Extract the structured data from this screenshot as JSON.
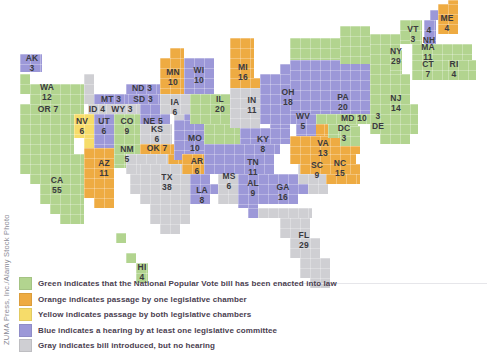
{
  "colors": {
    "green": "#b2d48f",
    "orange": "#eeab42",
    "yellow": "#f6dc6a",
    "blue": "#9c98d8",
    "gray": "#cfcfd3"
  },
  "legend": [
    {
      "color": "green",
      "text": "Green indicates that the National Popular Vote bill has been enacted into law"
    },
    {
      "color": "orange",
      "text": "Orange indicates passage by one legislative chamber"
    },
    {
      "color": "yellow",
      "text": "Yellow indicates passage by both legislative chambers"
    },
    {
      "color": "blue",
      "text": "Blue indicates a hearing by at least one legislative committee"
    },
    {
      "color": "gray",
      "text": "Gray indicates bill introduced, but no hearing"
    }
  ],
  "credit": "ZUMA Press, Inc./Alamy Stock Photo",
  "states": [
    {
      "abbr": "AK",
      "votes": "3",
      "status": "blue"
    },
    {
      "abbr": "WA",
      "votes": "12",
      "status": "green"
    },
    {
      "abbr": "OR",
      "votes": "7",
      "status": "green"
    },
    {
      "abbr": "CA",
      "votes": "55",
      "status": "green"
    },
    {
      "abbr": "NV",
      "votes": "6",
      "status": "yellow"
    },
    {
      "abbr": "ID",
      "votes": "4",
      "status": "gray"
    },
    {
      "abbr": "MT",
      "votes": "3",
      "status": "blue"
    },
    {
      "abbr": "WY",
      "votes": "3",
      "status": "gray"
    },
    {
      "abbr": "UT",
      "votes": "6",
      "status": "blue"
    },
    {
      "abbr": "CO",
      "votes": "9",
      "status": "green"
    },
    {
      "abbr": "AZ",
      "votes": "11",
      "status": "orange"
    },
    {
      "abbr": "NM",
      "votes": "5",
      "status": "green"
    },
    {
      "abbr": "ND",
      "votes": "3",
      "status": "blue"
    },
    {
      "abbr": "SD",
      "votes": "3",
      "status": "blue"
    },
    {
      "abbr": "NE",
      "votes": "5",
      "status": "blue"
    },
    {
      "abbr": "KS",
      "votes": "6",
      "status": "gray"
    },
    {
      "abbr": "OK",
      "votes": "7",
      "status": "orange"
    },
    {
      "abbr": "TX",
      "votes": "38",
      "status": "gray"
    },
    {
      "abbr": "MN",
      "votes": "10",
      "status": "orange"
    },
    {
      "abbr": "IA",
      "votes": "6",
      "status": "gray"
    },
    {
      "abbr": "MO",
      "votes": "10",
      "status": "blue"
    },
    {
      "abbr": "AR",
      "votes": "6",
      "status": "orange"
    },
    {
      "abbr": "LA",
      "votes": "8",
      "status": "blue"
    },
    {
      "abbr": "WI",
      "votes": "10",
      "status": "blue"
    },
    {
      "abbr": "IL",
      "votes": "20",
      "status": "green"
    },
    {
      "abbr": "MI",
      "votes": "16",
      "status": "orange"
    },
    {
      "abbr": "IN",
      "votes": "11",
      "status": "gray"
    },
    {
      "abbr": "OH",
      "votes": "18",
      "status": "blue"
    },
    {
      "abbr": "KY",
      "votes": "8",
      "status": "blue"
    },
    {
      "abbr": "TN",
      "votes": "11",
      "status": "blue"
    },
    {
      "abbr": "MS",
      "votes": "6",
      "status": "gray"
    },
    {
      "abbr": "AL",
      "votes": "9",
      "status": "blue"
    },
    {
      "abbr": "GA",
      "votes": "16",
      "status": "blue"
    },
    {
      "abbr": "FL",
      "votes": "29",
      "status": "gray"
    },
    {
      "abbr": "SC",
      "votes": "9",
      "status": "gray"
    },
    {
      "abbr": "NC",
      "votes": "15",
      "status": "orange"
    },
    {
      "abbr": "VA",
      "votes": "13",
      "status": "orange"
    },
    {
      "abbr": "WV",
      "votes": "5",
      "status": "blue"
    },
    {
      "abbr": "PA",
      "votes": "20",
      "status": "blue"
    },
    {
      "abbr": "MD",
      "votes": "10",
      "status": "green"
    },
    {
      "abbr": "DC",
      "votes": "3",
      "status": "green"
    },
    {
      "abbr": "DE",
      "votes": "3",
      "status": "green"
    },
    {
      "abbr": "NJ",
      "votes": "14",
      "status": "green"
    },
    {
      "abbr": "NY",
      "votes": "29",
      "status": "green"
    },
    {
      "abbr": "VT",
      "votes": "3",
      "status": "green"
    },
    {
      "abbr": "NH",
      "votes": "4",
      "status": "blue"
    },
    {
      "abbr": "ME",
      "votes": "4",
      "status": "orange"
    },
    {
      "abbr": "MA",
      "votes": "11",
      "status": "green"
    },
    {
      "abbr": "CT",
      "votes": "7",
      "status": "green"
    },
    {
      "abbr": "RI",
      "votes": "4",
      "status": "green"
    },
    {
      "abbr": "HI",
      "votes": "4",
      "status": "green"
    }
  ],
  "labels": {
    "AK": "AK\n3",
    "WA": "WA\n12",
    "OR": "OR 7",
    "CA": "CA\n55",
    "NV": "NV\n6",
    "ID": "ID 4",
    "MT": "MT 3",
    "WY": "WY 3",
    "UT": "UT\n6",
    "CO": "CO\n9",
    "AZ": "AZ\n11",
    "NM": "NM\n5",
    "ND": "ND 3",
    "SD": "SD 3",
    "NE": "NE 5",
    "KS": "KS\n6",
    "OK": "OK 7",
    "TX": "TX\n38",
    "MN": "MN\n10",
    "IA": "IA\n6",
    "MO": "MO\n10",
    "AR": "AR\n6",
    "LA": "LA\n8",
    "WI": "WI\n10",
    "IL": "IL\n20",
    "MI": "MI\n16",
    "IN": "IN\n11",
    "OH": "OH\n18",
    "KY": "KY\n8",
    "TN": "TN\n11",
    "MS": "MS\n6",
    "AL": "AL\n9",
    "GA": "GA\n16",
    "FL": "FL\n29",
    "SC": "SC\n9",
    "NC": "NC\n15",
    "VA": "VA\n13",
    "WV": "WV\n5",
    "PA": "PA\n20",
    "MD": "MD 10",
    "DC": "DC\n3",
    "DE": "3\nDE",
    "NJ": "NJ\n14",
    "NY": "NY\n29",
    "VT": "VT\n3",
    "NH": "4\nNH",
    "ME": "ME\n4",
    "MA": "MA\n11",
    "CT": "CT\n7",
    "RI": "RI\n4",
    "HI": "HI\n4"
  }
}
